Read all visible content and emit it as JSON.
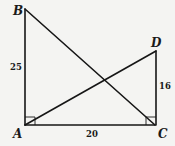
{
  "diagram": {
    "type": "geometry",
    "points": {
      "A": {
        "label": "A",
        "x": 25,
        "y": 125
      },
      "B": {
        "label": "B",
        "x": 25,
        "y": 9
      },
      "C": {
        "label": "C",
        "x": 155,
        "y": 125
      },
      "D": {
        "label": "D",
        "x": 156,
        "y": 51
      }
    },
    "segments": [
      {
        "from": "A",
        "to": "B",
        "length_label": "25"
      },
      {
        "from": "A",
        "to": "C",
        "length_label": "20"
      },
      {
        "from": "C",
        "to": "D",
        "length_label": "16"
      },
      {
        "from": "B",
        "to": "C",
        "length_label": ""
      },
      {
        "from": "A",
        "to": "D",
        "length_label": ""
      }
    ],
    "right_angles": [
      "A",
      "C"
    ],
    "labels": {
      "AB": "25",
      "AC": "20",
      "CD": "16"
    },
    "colors": {
      "line": "#161616",
      "background": "#f4f4f2"
    }
  }
}
